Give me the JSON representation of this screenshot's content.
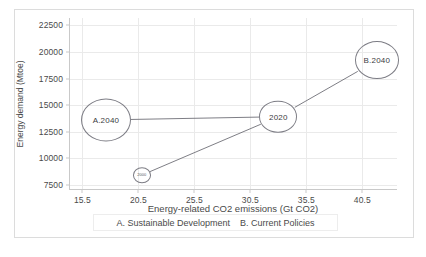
{
  "chart_data": {
    "type": "scatter",
    "title": "",
    "xlabel": "Energy-related CO2 emissions (Gt CO2)",
    "ylabel": "Energy demand (Mtoe)",
    "xlim": [
      14.3,
      43.6
    ],
    "ylim": [
      7000,
      23200
    ],
    "xticks": [
      "15.5",
      "20.5",
      "25.5",
      "30.5",
      "35.5",
      "40.5"
    ],
    "xtick_values": [
      15.5,
      20.5,
      25.5,
      30.5,
      35.5,
      40.5
    ],
    "yticks": [
      "7500",
      "10000",
      "12500",
      "15000",
      "17500",
      "20000",
      "22500"
    ],
    "ytick_values": [
      7500,
      10000,
      12500,
      15000,
      17500,
      20000,
      22500
    ],
    "grid": true,
    "legend_position": "below-axis",
    "points": [
      {
        "label": "2000",
        "x": 20.8,
        "y": 8400,
        "radius": 9
      },
      {
        "label": "2020",
        "x": 33.0,
        "y": 13900,
        "radius": 19
      },
      {
        "label": "A.2040",
        "x": 17.6,
        "y": 13600,
        "radius": 25
      },
      {
        "label": "B.2040",
        "x": 41.8,
        "y": 19200,
        "radius": 22
      }
    ],
    "series": [
      {
        "name": "A. Sustainable Development",
        "path": [
          "2020",
          "A.2040"
        ]
      },
      {
        "name": "B. Current Policies",
        "path": [
          "2000",
          "2020",
          "B.2040"
        ]
      }
    ],
    "legend": [
      "A. Sustainable Development",
      "B. Current Policies"
    ]
  }
}
